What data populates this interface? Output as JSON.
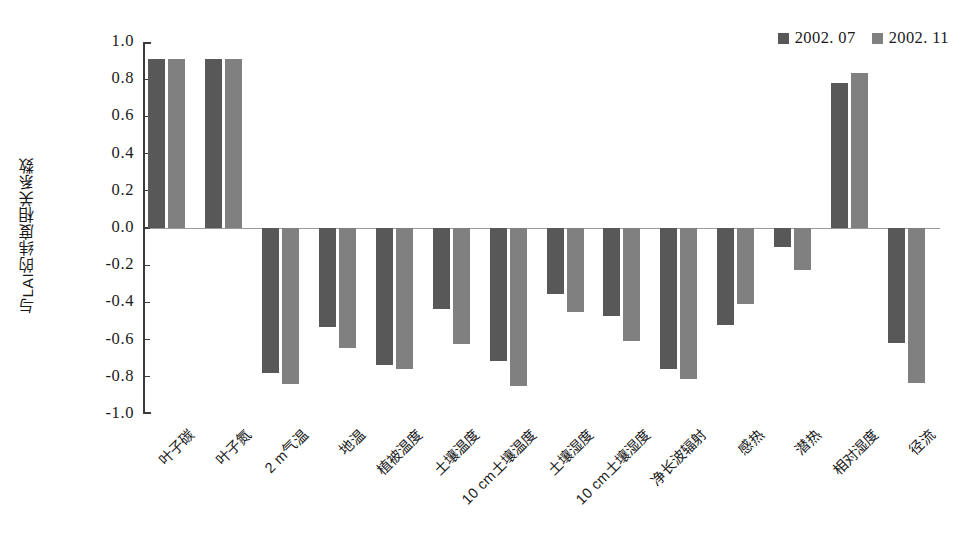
{
  "chart_data": {
    "type": "bar",
    "title": "",
    "subtitle": "",
    "xlabel": "",
    "ylabel": "与LAI的纬度相关系数",
    "ylim": [
      -1.0,
      1.0
    ],
    "ytick_labels": [
      "1.0",
      "0.8",
      "0.6",
      "0.4",
      "0.2",
      "0.0",
      "-0.2",
      "-0.4",
      "-0.6",
      "-0.8",
      "-1.0"
    ],
    "ytick_values": [
      1.0,
      0.8,
      0.6,
      0.4,
      0.2,
      0.0,
      -0.2,
      -0.4,
      -0.6,
      -0.8,
      -1.0
    ],
    "grid": false,
    "legend_position": "top-right",
    "categories": [
      "叶子碳",
      "叶子氮",
      "2 m气温",
      "地温",
      "植被温度",
      "土壤温度",
      "10 cm土壤温度",
      "土壤湿度",
      "10 cm土壤湿度",
      "净长波辐射",
      "感热",
      "潜热",
      "相对湿度",
      "径流"
    ],
    "series": [
      {
        "name": "2002. 07",
        "color": "#585858",
        "values": [
          0.91,
          0.91,
          -0.78,
          -0.53,
          -0.735,
          -0.435,
          -0.715,
          -0.355,
          -0.475,
          -0.76,
          -0.52,
          -0.1,
          0.78,
          -0.62
        ]
      },
      {
        "name": "2002. 11",
        "color": "#808080",
        "values": [
          0.91,
          0.91,
          -0.84,
          -0.645,
          -0.76,
          -0.625,
          -0.85,
          -0.45,
          -0.61,
          -0.81,
          -0.41,
          -0.225,
          0.835,
          -0.835
        ]
      }
    ]
  },
  "legend": {
    "items": [
      {
        "label": "2002. 07",
        "color": "#585858"
      },
      {
        "label": "2002. 11",
        "color": "#808080"
      }
    ]
  },
  "axis": {
    "y_title": "与LAI的纬度相关系数"
  }
}
